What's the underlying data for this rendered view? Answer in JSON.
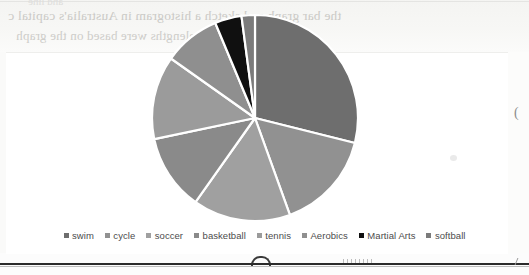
{
  "document": {
    "bleed_text_top": "the bar graph and sketch a histogram in Australia's capital c",
    "bleed_text_mid": "wavelengths were based on the graph",
    "bleed_text_faint": "and line"
  },
  "margin": {
    "paren_glyph": "("
  },
  "chart_data": {
    "type": "pie",
    "title": "",
    "legend_position": "bottom",
    "grid": false,
    "categories": [
      "swim",
      "cycle",
      "soccer",
      "basketball",
      "tennis",
      "Aerobics",
      "Martial Arts",
      "softball"
    ],
    "values": [
      28.9,
      15.6,
      15.3,
      11.9,
      13.1,
      8.9,
      4.2,
      2.1
    ],
    "units": "percent",
    "start_angle_deg": 0,
    "direction": "clockwise",
    "colors": [
      "#6e6e6e",
      "#919191",
      "#a0a0a0",
      "#8a8a8a",
      "#9b9b9b",
      "#8f8f8f",
      "#101010",
      "#7b7b7b"
    ],
    "slice_separator_color": "#ffffff",
    "center": {
      "cx": 255,
      "cy": 118
    },
    "radius": 103
  },
  "legend": {
    "items": [
      {
        "label": "swim",
        "color": "#6e6e6e"
      },
      {
        "label": "cycle",
        "color": "#919191"
      },
      {
        "label": "soccer",
        "color": "#a0a0a0"
      },
      {
        "label": "basketball",
        "color": "#8a8a8a"
      },
      {
        "label": "tennis",
        "color": "#9b9b9b"
      },
      {
        "label": "Aerobics",
        "color": "#8f8f8f"
      },
      {
        "label": "Martial Arts",
        "color": "#101010"
      },
      {
        "label": "softball",
        "color": "#7b7b7b"
      }
    ]
  }
}
